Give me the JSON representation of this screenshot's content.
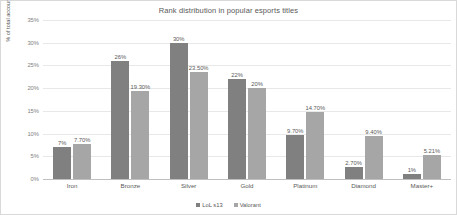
{
  "chart_data": {
    "type": "bar",
    "title": "Rank distribution in popular esports titles",
    "xlabel": "",
    "ylabel": "% of total accounts",
    "ylim": [
      0,
      35
    ],
    "ytick_step": 5,
    "ytick_labels": [
      "0%",
      "5%",
      "10%",
      "15%",
      "20%",
      "25%",
      "30%",
      "35%"
    ],
    "grid": true,
    "legend_position": "bottom",
    "categories": [
      "Iron",
      "Bronze",
      "Silver",
      "Gold",
      "Platinum",
      "Diamond",
      "Master+"
    ],
    "series": [
      {
        "name": "LoL s13",
        "color": "#808080",
        "values": [
          7,
          26,
          30,
          22,
          9.7,
          2.7,
          1
        ],
        "labels": [
          "7%",
          "26%",
          "30%",
          "22%",
          "9.70%",
          "2.70%",
          "1%"
        ]
      },
      {
        "name": "Valorant",
        "color": "#a6a6a6",
        "values": [
          7.7,
          19.3,
          23.5,
          20,
          14.7,
          9.4,
          5.21
        ],
        "labels": [
          "7.70%",
          "19.30%",
          "23.50%",
          "20%",
          "14.70%",
          "9.40%",
          "5.21%"
        ]
      }
    ]
  }
}
